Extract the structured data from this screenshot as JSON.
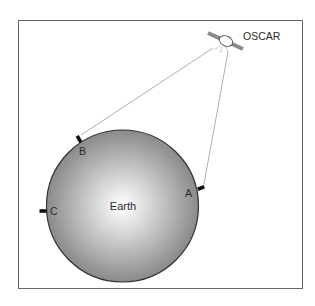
{
  "diagram": {
    "satellite": {
      "label": "OSCAR",
      "icon": "satellite-icon"
    },
    "earth": {
      "label": "Earth"
    },
    "stations": [
      {
        "id": "A",
        "label": "A"
      },
      {
        "id": "B",
        "label": "B"
      },
      {
        "id": "C",
        "label": "C"
      }
    ],
    "colors": {
      "frame": "#555555",
      "earth_edge": "#333333",
      "earth_center": "#ffffff",
      "earth_outer": "#8c8c8c",
      "link_line": "#999999",
      "marker": "#111111"
    }
  }
}
